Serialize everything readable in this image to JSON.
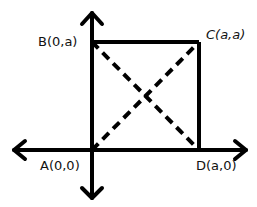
{
  "diagram": {
    "type": "coordinate-square",
    "points": [
      {
        "id": "A",
        "label": "A(0,0)"
      },
      {
        "id": "B",
        "label": "B(0,a)"
      },
      {
        "id": "C",
        "label": "C(a,a)"
      },
      {
        "id": "D",
        "label": "D(a,0)"
      }
    ],
    "edges": [
      "AB",
      "BC",
      "CD",
      "DA"
    ],
    "diagonals": [
      "AC",
      "BD"
    ],
    "diagonal_style": "dashed",
    "axes": {
      "x": "double-arrow",
      "y": "double-arrow"
    },
    "stroke_color": "#000000"
  }
}
